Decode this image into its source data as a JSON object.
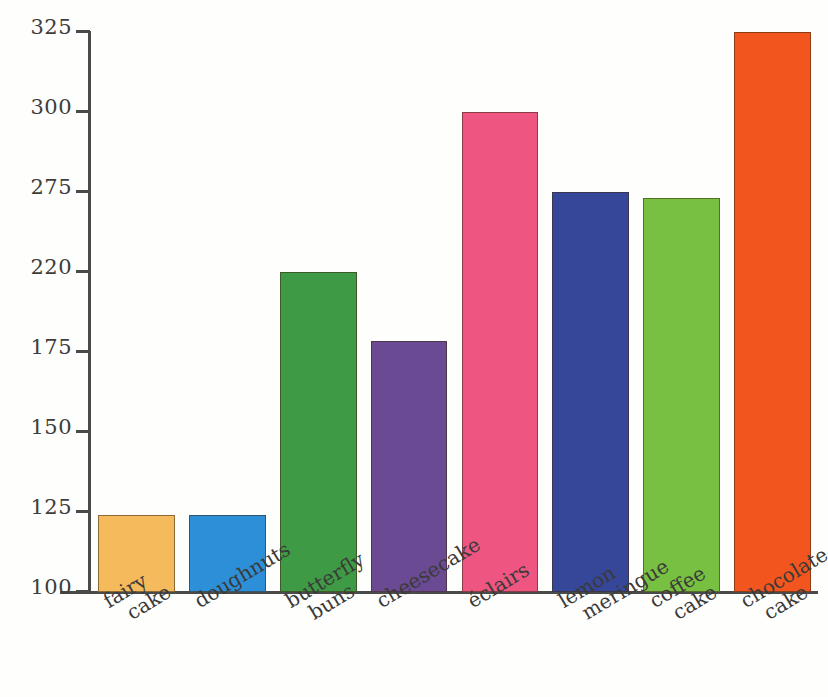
{
  "chart_data": {
    "type": "bar",
    "title": "",
    "xlabel": "",
    "ylabel": "",
    "categories": [
      "fairy cake",
      "doughnuts",
      "butterfly buns",
      "cheesecake",
      "éclairs",
      "lemon meringue",
      "coffee cake",
      "chocolate cake"
    ],
    "category_lines": [
      [
        "fairy",
        "cake"
      ],
      [
        "doughnuts"
      ],
      [
        "butterfly",
        "buns"
      ],
      [
        "cheesecake"
      ],
      [
        "éclairs"
      ],
      [
        "lemon",
        "meringue"
      ],
      [
        "coffee",
        "cake"
      ],
      [
        "chocolate",
        "cake"
      ]
    ],
    "values": [
      124,
      124,
      220,
      181,
      300,
      275,
      271,
      325
    ],
    "colors": [
      "#F5BA5C",
      "#2C8FD8",
      "#3E9A45",
      "#6A4B93",
      "#EE5580",
      "#36479A",
      "#78C042",
      "#F2561E"
    ],
    "ytick_labels": [
      "325",
      "300",
      "275",
      "220",
      "175",
      "150",
      "125",
      "100"
    ],
    "ytick_values": [
      325,
      300,
      275,
      220,
      175,
      150,
      125,
      100
    ],
    "ylim": [
      100,
      325
    ],
    "grid": false,
    "legend": false,
    "note": "y-axis tick labels are evenly spaced on the page despite unequal numeric gaps (220 follows 175 then 275)"
  },
  "axis": {
    "y_axis_name": "y-axis",
    "x_axis_name": "x-axis"
  }
}
